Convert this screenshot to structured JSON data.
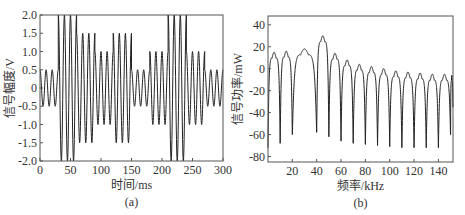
{
  "chart_data": [
    {
      "type": "line",
      "panel": "(a)",
      "title": "",
      "xlabel": "时间/ms",
      "ylabel": "信号幅度/V",
      "xlim": [
        0,
        300
      ],
      "ylim": [
        -2.0,
        2.0
      ],
      "xticks": [
        0,
        50,
        100,
        150,
        200,
        250,
        300
      ],
      "yticks": [
        "-2.0",
        "-1.5",
        "-1.0",
        "-0.5",
        "0",
        "0.5",
        "1.0",
        "1.5",
        "2.0"
      ],
      "description": "Multi-tone burst signal; each segment of 3 cycles with amplitude pattern",
      "segments": [
        {
          "x_start": 0,
          "x_end": 30,
          "amplitude": 0.5
        },
        {
          "x_start": 30,
          "x_end": 60,
          "amplitude": 2.0
        },
        {
          "x_start": 60,
          "x_end": 90,
          "amplitude": 1.5
        },
        {
          "x_start": 90,
          "x_end": 120,
          "amplitude": 1.0
        },
        {
          "x_start": 120,
          "x_end": 150,
          "amplitude": 1.5
        },
        {
          "x_start": 150,
          "x_end": 180,
          "amplitude": 0.5
        },
        {
          "x_start": 180,
          "x_end": 210,
          "amplitude": 1.0
        },
        {
          "x_start": 210,
          "x_end": 240,
          "amplitude": 2.0
        },
        {
          "x_start": 240,
          "x_end": 270,
          "amplitude": 1.0
        },
        {
          "x_start": 270,
          "x_end": 300,
          "amplitude": 0.5
        }
      ],
      "grid": false
    },
    {
      "type": "line",
      "panel": "(b)",
      "title": "",
      "xlabel": "频率/kHz",
      "ylabel": "信号功率/mW",
      "xlim": [
        0,
        152
      ],
      "ylim": [
        -85,
        48
      ],
      "xticks": [
        20,
        40,
        60,
        80,
        100,
        120,
        140
      ],
      "yticks": [
        -80,
        -60,
        -40,
        -20,
        0,
        20,
        40
      ],
      "lobe_centers_kHz": [
        5,
        15,
        25,
        35,
        45,
        55,
        65,
        75,
        85,
        95,
        105,
        115,
        125,
        135,
        145
      ],
      "lobe_peaks": [
        15,
        16,
        18,
        30,
        14,
        8,
        4,
        2,
        0,
        -2,
        -3,
        -4,
        -5,
        -5,
        -6
      ],
      "nulls_kHz": [
        0,
        10,
        20,
        40,
        50,
        60,
        70,
        80,
        90,
        100,
        110,
        120,
        130,
        140,
        150
      ],
      "null_depths": [
        -72,
        -68,
        -60,
        -58,
        -62,
        -66,
        -68,
        -69,
        -70,
        -71,
        -72,
        -72,
        -72,
        -72,
        -60
      ],
      "peak": {
        "x": 31,
        "y": 44
      },
      "grid": false
    }
  ],
  "panel_a": {
    "label": "(a)",
    "xlabel": "时间/ms",
    "ylabel": "信号幅度/V",
    "xticks": [
      "0",
      "50",
      "100",
      "150",
      "200",
      "250",
      "300"
    ],
    "yticks": [
      "2.0",
      "1.5",
      "1.0",
      "0.5",
      "0",
      "-0.5",
      "-1.0",
      "-1.5",
      "-2.0"
    ]
  },
  "panel_b": {
    "label": "(b)",
    "xlabel": "频率/kHz",
    "ylabel": "信号功率/mW",
    "xticks": [
      "20",
      "40",
      "60",
      "80",
      "100",
      "120",
      "140"
    ],
    "yticks": [
      "40",
      "20",
      "0",
      "-20",
      "-40",
      "-60",
      "-80"
    ]
  }
}
